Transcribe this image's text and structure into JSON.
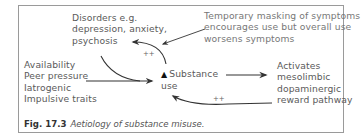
{
  "figure": {
    "number_label": "Fig. 17.3",
    "title": "Aetiology of substance misuse."
  },
  "nodes": {
    "disorders": {
      "lines": [
        "Disorders e.g.",
        "depression, anxiety,",
        "psychosis"
      ]
    },
    "masking_note": {
      "lines": [
        "Temporary masking of symptoms",
        "encourages use but overall use",
        "worsens symptoms"
      ]
    },
    "risk_factors": {
      "lines": [
        "Availability",
        "Peer pressure",
        "Iatrogenic",
        "Impulsive traits"
      ]
    },
    "substance_use": {
      "marker": "▲",
      "lines": [
        "Substance",
        "use"
      ]
    },
    "reward_pathway": {
      "lines": [
        "Activates",
        "mesolimbic",
        "dopaminergic",
        "reward pathway"
      ]
    }
  },
  "edges": {
    "substance_to_disorders_label": "++",
    "reward_to_substance_label": "++"
  },
  "colors": {
    "border": "#9a9a9a",
    "text": "#5a5a5a",
    "arrow": "#333333"
  }
}
